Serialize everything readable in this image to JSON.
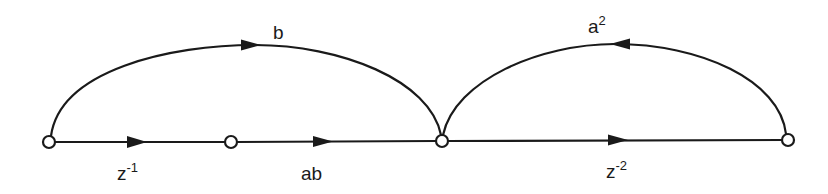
{
  "diagram": {
    "type": "signal-flow-graph",
    "nodes": [
      {
        "id": "n0",
        "x": 49,
        "y": 142
      },
      {
        "id": "n1",
        "x": 231,
        "y": 142
      },
      {
        "id": "n2",
        "x": 442,
        "y": 141
      },
      {
        "id": "n3",
        "x": 788,
        "y": 140
      }
    ],
    "branches": [
      {
        "from": "n0",
        "to": "n1",
        "gain_base": "z",
        "gain_sup": "-1",
        "kind": "straight"
      },
      {
        "from": "n1",
        "to": "n2",
        "gain_base": "ab",
        "gain_sup": "",
        "kind": "straight"
      },
      {
        "from": "n2",
        "to": "n3",
        "gain_base": "z",
        "gain_sup": "-2",
        "kind": "straight"
      },
      {
        "from": "n0",
        "to": "n2",
        "gain_base": "b",
        "gain_sup": "",
        "kind": "arc"
      },
      {
        "from": "n3",
        "to": "n2",
        "gain_base": "a",
        "gain_sup": "2",
        "kind": "arc"
      }
    ],
    "labels": {
      "z_inv1_base": "z",
      "z_inv1_sup": "-1",
      "ab": "ab",
      "z_inv2_base": "z",
      "z_inv2_sup": "-2",
      "b": "b",
      "a2_base": "a",
      "a2_sup": "2"
    },
    "colors": {
      "stroke": "#1a1a1a",
      "node_fill": "#ffffff",
      "background": "#ffffff"
    }
  }
}
